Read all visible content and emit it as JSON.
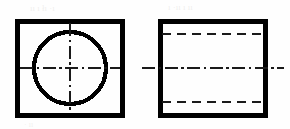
{
  "drawing": {
    "title": "Orthographic projection: square block with through hole",
    "canvas": {
      "width": 290,
      "height": 129,
      "background": "#fefefe"
    },
    "line_colors": {
      "visible": "#000000",
      "hidden": "#1a1a1a",
      "center": "#1a1a1a"
    },
    "line_weights": {
      "visible_outline": 5.0,
      "circle_outline": 4.2,
      "hidden": 2.6,
      "center": 2.0
    },
    "views": [
      {
        "id": "front-view",
        "name": "Front view",
        "type": "square-with-circle",
        "outline": {
          "x": 17,
          "y": 21,
          "width": 105,
          "height": 94
        },
        "circle": {
          "cx": 70,
          "cy": 68,
          "r": 36
        },
        "centerlines": [
          {
            "id": "front-vertical-centerline",
            "orientation": "vertical",
            "x": 70,
            "y1": 23,
            "y2": 113,
            "pattern": "center",
            "dasharray": "13,3.5,2.5,3.5"
          },
          {
            "id": "front-horizontal-centerline",
            "orientation": "horizontal",
            "y": 68,
            "x1": 20,
            "x2": 120,
            "pattern": "center",
            "dasharray": "13,3.5,2.5,3.5"
          }
        ]
      },
      {
        "id": "side-view",
        "name": "Side view",
        "type": "rectangle-with-hidden-lines",
        "outline": {
          "x": 160,
          "y": 21,
          "width": 105,
          "height": 94
        },
        "hidden_lines": [
          {
            "id": "side-hidden-line-top",
            "orientation": "horizontal",
            "y": 34,
            "x1": 162,
            "x2": 263,
            "pattern": "hidden",
            "dasharray": "9,6"
          },
          {
            "id": "side-hidden-line-bottom",
            "orientation": "horizontal",
            "y": 102,
            "x1": 162,
            "x2": 263,
            "pattern": "hidden",
            "dasharray": "9,6"
          }
        ],
        "centerlines": [
          {
            "id": "side-horizontal-centerline",
            "orientation": "horizontal",
            "y": 68,
            "x1": 142,
            "x2": 284,
            "pattern": "center",
            "dasharray": "13,3.5,2.5,3.5"
          }
        ]
      }
    ],
    "scan_artifacts": [
      {
        "id": "bleed-top-left",
        "text": "ıı ı łı ·ı",
        "x": 30,
        "y": 3,
        "size": 9
      },
      {
        "id": "bleed-top-right",
        "text": "ı ·ıı ı ıı",
        "x": 168,
        "y": 2,
        "size": 9
      },
      {
        "id": "bleed-bottom-left",
        "text": "· ıı",
        "x": 24,
        "y": 120,
        "size": 8
      }
    ]
  }
}
